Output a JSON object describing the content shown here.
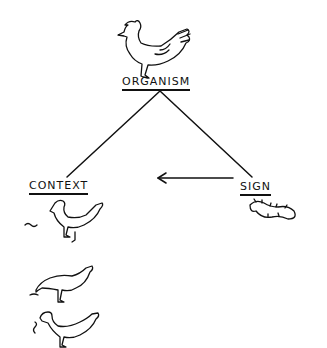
{
  "diagram": {
    "nodes": [
      {
        "id": "organism",
        "label": "ORGANISM",
        "icon": "hen-icon"
      },
      {
        "id": "context",
        "label": "CONTEXT",
        "icon": "hen-sequence-icons"
      },
      {
        "id": "sign",
        "label": "SIGN",
        "icon": "caterpillar-icon"
      }
    ],
    "edges": [
      {
        "from": "organism",
        "to": "context",
        "type": "line"
      },
      {
        "from": "organism",
        "to": "sign",
        "type": "line"
      },
      {
        "from": "sign",
        "to": "context",
        "type": "arrow"
      }
    ],
    "context_sequence": [
      "hen-sees-worm",
      "hen-pecks-worm",
      "hen-eats-worm"
    ],
    "colors": {
      "ink": "#111111",
      "background": "#ffffff"
    }
  }
}
